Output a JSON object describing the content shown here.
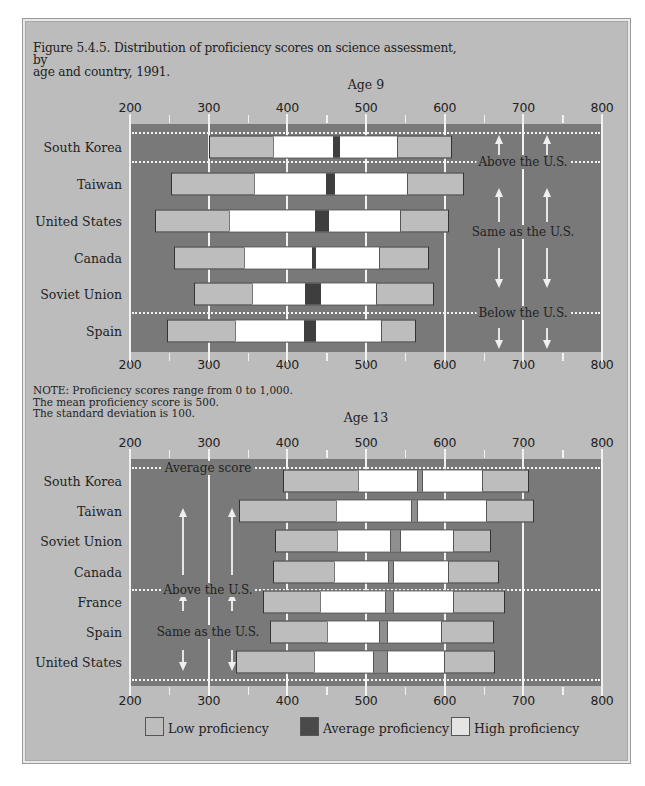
{
  "figure": {
    "title_line1": "Figure 5.4.5. Distribution of proficiency scores on science assessment, by",
    "title_line2": "age and country, 1991."
  },
  "note": {
    "line1": "NOTE: Proficiency scores range from 0 to 1,000.",
    "line2": "The mean proficiency score is 500.",
    "line3": "The standard deviation is 100."
  },
  "legend": {
    "low": "Low proficiency",
    "average": "Average proficiency",
    "high": "High proficiency",
    "colors": {
      "low": "#bdbdbd",
      "average": "#3e3e3e",
      "high": "#ffffff"
    }
  },
  "colors": {
    "plot_background": "#797979",
    "frame_background": "#bcbcbc",
    "gridline": "#f2f2f2"
  },
  "chart_data": [
    {
      "type": "bar",
      "subtype": "horizontal percentile range bars",
      "title": "Age 9",
      "xlabel": "",
      "ylabel": "",
      "xlim": [
        200,
        800
      ],
      "ticks": [
        200,
        300,
        400,
        500,
        600,
        700,
        800
      ],
      "tick_labels": [
        "200",
        "300",
        "400",
        "500",
        "600",
        "700",
        "800"
      ],
      "grid": true,
      "categories": [
        "South Korea",
        "Taiwan",
        "United States",
        "Canada",
        "Soviet Union",
        "Spain"
      ],
      "series": [
        {
          "name": "Bar start (low)",
          "values": [
            301,
            252,
            232,
            256,
            281,
            247
          ]
        },
        {
          "name": "Low proficiency end",
          "values": [
            382,
            357,
            326,
            345,
            355,
            333
          ]
        },
        {
          "name": "Average proficiency start",
          "values": [
            458,
            449,
            435,
            431,
            422,
            421
          ]
        },
        {
          "name": "Average proficiency end",
          "values": [
            467,
            461,
            453,
            437,
            443,
            436
          ]
        },
        {
          "name": "High proficiency end",
          "values": [
            540,
            552,
            543,
            516,
            513,
            519
          ]
        },
        {
          "name": "Bar end (high)",
          "values": [
            609,
            624,
            605,
            580,
            586,
            564
          ]
        }
      ],
      "groups": [
        {
          "label": "Above the U.S.",
          "countries": [
            "South Korea"
          ]
        },
        {
          "label": "Same as the U.S.",
          "countries": [
            "Taiwan",
            "United States",
            "Canada",
            "Soviet Union"
          ]
        },
        {
          "label": "Below the U.S.",
          "countries": [
            "Spain"
          ]
        }
      ],
      "legend": [
        "Low proficiency",
        "Average proficiency",
        "High proficiency"
      ],
      "legend_position": "bottom"
    },
    {
      "type": "bar",
      "subtype": "horizontal percentile range bars",
      "title": "Age 13",
      "xlabel": "",
      "ylabel": "",
      "xlim": [
        200,
        800
      ],
      "ticks": [
        200,
        300,
        400,
        500,
        600,
        700,
        800
      ],
      "tick_labels": [
        "200",
        "300",
        "400",
        "500",
        "600",
        "700",
        "800"
      ],
      "grid": true,
      "categories": [
        "South Korea",
        "Taiwan",
        "Soviet Union",
        "Canada",
        "France",
        "Spain",
        "United States"
      ],
      "series": [
        {
          "name": "Bar start (low)",
          "values": [
            395,
            338,
            384,
            382,
            369,
            378,
            335
          ]
        },
        {
          "name": "Low proficiency end",
          "values": [
            490,
            462,
            463,
            459,
            442,
            451,
            434
          ]
        },
        {
          "name": "Average proficiency start",
          "values": [
            565,
            557,
            530,
            528,
            524,
            517,
            509
          ]
        },
        {
          "name": "Average proficiency end",
          "values": [
            572,
            566,
            545,
            535,
            535,
            528,
            528
          ]
        },
        {
          "name": "High proficiency end",
          "values": [
            647,
            653,
            611,
            604,
            610,
            595,
            599
          ]
        },
        {
          "name": "Bar end (high)",
          "values": [
            707,
            713,
            659,
            669,
            677,
            663,
            664
          ]
        }
      ],
      "groups": [
        {
          "label": "Average score",
          "countries": []
        },
        {
          "label": "Above the U.S.",
          "countries": [
            "South Korea",
            "Taiwan",
            "Soviet Union",
            "Canada"
          ]
        },
        {
          "label": "Same as the U.S.",
          "countries": [
            "France",
            "Spain",
            "United States"
          ]
        }
      ],
      "legend": [
        "Low proficiency",
        "Average proficiency",
        "High proficiency"
      ],
      "legend_position": "bottom"
    }
  ],
  "panels": {
    "age9": {
      "title": "Age 9",
      "annotations": {
        "above": "Above the U.S.",
        "same": "Same as the U.S.",
        "below": "Below the U.S."
      }
    },
    "age13": {
      "title": "Age 13",
      "annotations": {
        "average": "Average score",
        "above": "Above the U.S.",
        "same": "Same as the U.S."
      }
    }
  }
}
